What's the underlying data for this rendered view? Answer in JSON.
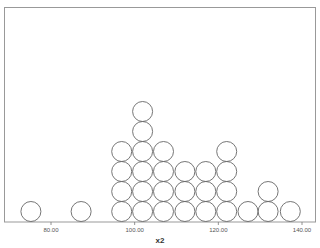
{
  "chart_data": {
    "type": "dot",
    "title": "",
    "xlabel": "x2",
    "ylabel": "",
    "xlim": [
      69.5,
      142.5
    ],
    "x_ticks": [
      80,
      100,
      120,
      140
    ],
    "x_tick_labels": [
      "80.00",
      "100.00",
      "120.00",
      "140.00"
    ],
    "grid": false,
    "legend": null,
    "stacks": [
      {
        "x": 75.2,
        "count": 1
      },
      {
        "x": 87.2,
        "count": 1
      },
      {
        "x": 96.9,
        "count": 4
      },
      {
        "x": 101.9,
        "count": 6
      },
      {
        "x": 106.9,
        "count": 4
      },
      {
        "x": 112.0,
        "count": 3
      },
      {
        "x": 117.0,
        "count": 3
      },
      {
        "x": 122.0,
        "count": 4
      },
      {
        "x": 127.1,
        "count": 1
      },
      {
        "x": 131.9,
        "count": 2
      },
      {
        "x": 137.2,
        "count": 1
      }
    ]
  }
}
